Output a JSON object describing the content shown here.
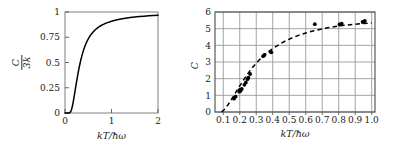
{
  "figure": {
    "title": "",
    "panels": [
      "left-einstein-curve",
      "right-diamond-data"
    ]
  },
  "chart_data": [
    {
      "id": "left",
      "type": "line",
      "title": "",
      "xlabel": "kT/ħω",
      "ylabel_numerator": "C",
      "ylabel_denominator": "3k",
      "ylabel": "C/3k",
      "xlim": [
        0,
        2
      ],
      "ylim": [
        0,
        1
      ],
      "grid": false,
      "xticks": [
        0,
        1,
        2
      ],
      "xticklabels": [
        "0",
        "1",
        "2"
      ],
      "yticks": [
        0,
        0.25,
        0.5,
        0.75,
        1
      ],
      "yticklabels": [
        "0",
        "0.25",
        "0.5",
        "0.75",
        "1"
      ],
      "line_style": "solid",
      "line_color": "#000000",
      "x": [
        0.0,
        0.05,
        0.08,
        0.1,
        0.12,
        0.14,
        0.16,
        0.18,
        0.2,
        0.22,
        0.25,
        0.28,
        0.3,
        0.33,
        0.36,
        0.4,
        0.44,
        0.48,
        0.52,
        0.56,
        0.6,
        0.65,
        0.7,
        0.75,
        0.8,
        0.85,
        0.9,
        1.0,
        1.1,
        1.2,
        1.3,
        1.4,
        1.5,
        1.6,
        1.7,
        1.8,
        1.9,
        2.0
      ],
      "y": [
        0.0,
        0.0,
        0.0,
        0.002,
        0.011,
        0.033,
        0.069,
        0.117,
        0.171,
        0.228,
        0.313,
        0.392,
        0.44,
        0.505,
        0.561,
        0.625,
        0.676,
        0.717,
        0.75,
        0.778,
        0.8,
        0.824,
        0.843,
        0.859,
        0.872,
        0.883,
        0.892,
        0.908,
        0.92,
        0.93,
        0.938,
        0.945,
        0.95,
        0.955,
        0.959,
        0.962,
        0.965,
        0.968
      ]
    },
    {
      "id": "right",
      "type": "scatter",
      "title": "",
      "xlabel": "kT/ħω",
      "ylabel": "C",
      "xlim": [
        0.05,
        1.02
      ],
      "ylim": [
        0,
        6
      ],
      "grid": true,
      "xticks": [
        0.1,
        0.2,
        0.3,
        0.4,
        0.5,
        0.6,
        0.7,
        0.8,
        0.9,
        1.0
      ],
      "xticklabels": [
        "0.1",
        "0.2",
        "0.3",
        "0.4",
        "0.5",
        "0.6",
        "0.7",
        "0.8",
        "0.9",
        "1.0"
      ],
      "yticks": [
        0,
        1,
        2,
        3,
        4,
        5,
        6
      ],
      "yticklabels": [
        "0",
        "1",
        "2",
        "3",
        "4",
        "5",
        "6"
      ],
      "fit_style": "dashed",
      "fit_color": "#000000",
      "marker_color": "#000000",
      "points": [
        {
          "x": 0.165,
          "y": 0.8
        },
        {
          "x": 0.175,
          "y": 0.92
        },
        {
          "x": 0.197,
          "y": 1.22
        },
        {
          "x": 0.2,
          "y": 1.33
        },
        {
          "x": 0.205,
          "y": 1.27
        },
        {
          "x": 0.212,
          "y": 1.38
        },
        {
          "x": 0.228,
          "y": 1.63
        },
        {
          "x": 0.237,
          "y": 1.77
        },
        {
          "x": 0.247,
          "y": 1.97
        },
        {
          "x": 0.252,
          "y": 2.06
        },
        {
          "x": 0.263,
          "y": 2.28
        },
        {
          "x": 0.342,
          "y": 3.35
        },
        {
          "x": 0.35,
          "y": 3.42
        },
        {
          "x": 0.386,
          "y": 3.62
        },
        {
          "x": 0.392,
          "y": 3.58
        },
        {
          "x": 0.655,
          "y": 5.27
        },
        {
          "x": 0.805,
          "y": 5.25
        },
        {
          "x": 0.818,
          "y": 5.3
        },
        {
          "x": 0.945,
          "y": 5.4
        },
        {
          "x": 0.958,
          "y": 5.46
        }
      ],
      "fit_x": [
        0.09,
        0.11,
        0.13,
        0.15,
        0.17,
        0.19,
        0.21,
        0.23,
        0.25,
        0.275,
        0.3,
        0.325,
        0.35,
        0.38,
        0.41,
        0.445,
        0.48,
        0.52,
        0.56,
        0.6,
        0.65,
        0.7,
        0.75,
        0.8,
        0.85,
        0.9,
        0.95,
        1.0
      ],
      "fit_y": [
        0.0,
        0.18,
        0.45,
        0.76,
        1.08,
        1.4,
        1.72,
        2.03,
        2.32,
        2.64,
        2.93,
        3.19,
        3.42,
        3.66,
        3.87,
        4.09,
        4.28,
        4.46,
        4.61,
        4.74,
        4.88,
        4.99,
        5.08,
        5.16,
        5.22,
        5.27,
        5.31,
        5.35
      ]
    }
  ],
  "left_panel": {
    "name": "einstein-heat-capacity-curve",
    "xlabel": "kT/ħω",
    "y_num": "C",
    "y_den": "3k",
    "xtick_0": "0",
    "xtick_1": "1",
    "xtick_2": "2",
    "ytick_0": "0",
    "ytick_1": "0.25",
    "ytick_2": "0.5",
    "ytick_3": "0.75",
    "ytick_4": "1"
  },
  "right_panel": {
    "name": "diamond-heat-capacity-data",
    "xlabel": "kT/ħω",
    "ylabel": "C"
  }
}
